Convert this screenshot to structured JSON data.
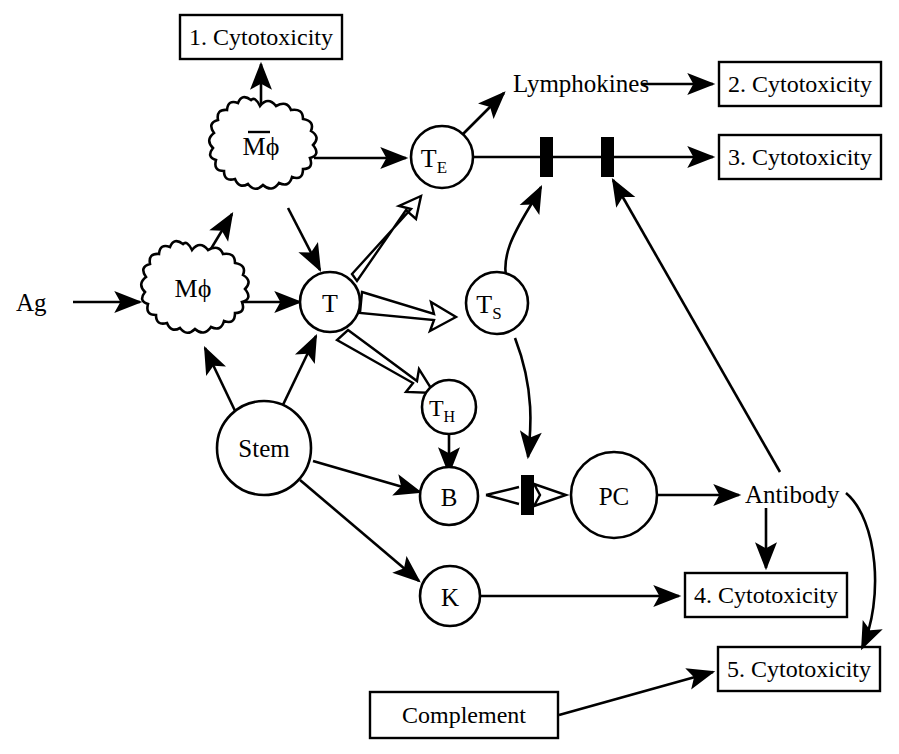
{
  "diagram": {
    "background_color": "#ffffff",
    "stroke_color": "#000000",
    "nodes": {
      "ag": {
        "label": "Ag",
        "type": "plain-text"
      },
      "macrophage": {
        "label": "Mϕ",
        "type": "wavy-circle"
      },
      "activated_macrophage": {
        "label": "Mϕ",
        "overbar": true,
        "type": "wavy-circle"
      },
      "t_cell": {
        "label": "T",
        "type": "circle"
      },
      "te_cell": {
        "label": "T",
        "sub": "E",
        "type": "circle"
      },
      "ts_cell": {
        "label": "T",
        "sub": "S",
        "type": "circle"
      },
      "th_cell": {
        "label": "T",
        "sub": "H",
        "type": "circle"
      },
      "b_cell": {
        "label": "B",
        "type": "circle"
      },
      "k_cell": {
        "label": "K",
        "type": "circle"
      },
      "pc_cell": {
        "label": "PC",
        "type": "circle"
      },
      "stem_cell": {
        "label": "Stem",
        "type": "circle"
      },
      "lymphokines": {
        "label": "Lymphokines",
        "type": "plain-text"
      },
      "antibody": {
        "label": "Antibody",
        "type": "plain-text"
      }
    },
    "boxes": [
      {
        "id": "box1",
        "label": "1. Cytotoxicity"
      },
      {
        "id": "box2",
        "label": "2. Cytotoxicity"
      },
      {
        "id": "box3",
        "label": "3. Cytotoxicity"
      },
      {
        "id": "box4",
        "label": "4. Cytotoxicity"
      },
      {
        "id": "box5",
        "label": "5. Cytotoxicity"
      },
      {
        "id": "complement",
        "label": "Complement"
      }
    ],
    "inhibition_bars": [
      {
        "id": "bar-te-1",
        "note": "first bar on T-E to 3. Cytotoxicity line"
      },
      {
        "id": "bar-te-2",
        "note": "second bar on T-E to 3. Cytotoxicity line"
      },
      {
        "id": "bar-b-pc",
        "note": "bar between B and PC"
      }
    ],
    "edges": [
      {
        "from": "Ag",
        "to": "Mϕ",
        "style": "solid-arrow"
      },
      {
        "from": "Mϕ",
        "to": "T",
        "style": "solid-arrow"
      },
      {
        "from": "Mϕ",
        "to": "Mϕ (activated)",
        "style": "solid-arrow"
      },
      {
        "from": "Mϕ (activated)",
        "to": "1. Cytotoxicity",
        "style": "solid-arrow"
      },
      {
        "from": "Mϕ (activated)",
        "to": "T",
        "style": "solid-arrow"
      },
      {
        "from": "Mϕ (activated)",
        "to": "T_E",
        "style": "solid-arrow"
      },
      {
        "from": "Stem",
        "to": "Mϕ",
        "style": "solid-arrow"
      },
      {
        "from": "Stem",
        "to": "T",
        "style": "solid-arrow"
      },
      {
        "from": "Stem",
        "to": "B",
        "style": "solid-arrow"
      },
      {
        "from": "Stem",
        "to": "K",
        "style": "solid-arrow"
      },
      {
        "from": "T",
        "to": "T_E",
        "style": "open-arrow"
      },
      {
        "from": "T",
        "to": "T_S",
        "style": "open-arrow"
      },
      {
        "from": "T",
        "to": "T_H",
        "style": "open-arrow"
      },
      {
        "from": "T_E",
        "to": "Lymphokines",
        "style": "solid-arrow"
      },
      {
        "from": "Lymphokines",
        "to": "2. Cytotoxicity",
        "style": "solid-arrow"
      },
      {
        "from": "T_E",
        "to": "3. Cytotoxicity",
        "style": "solid-line-with-two-bars"
      },
      {
        "from": "T_S",
        "to": "bar-te-1",
        "style": "curved-arrow"
      },
      {
        "from": "T_S",
        "to": "bar-b-pc",
        "style": "curved-arrow"
      },
      {
        "from": "Antibody",
        "to": "bar-te-2",
        "style": "solid-arrow"
      },
      {
        "from": "T_H",
        "to": "B",
        "style": "solid-arrow"
      },
      {
        "from": "B",
        "to": "PC",
        "style": "open-arrow-with-bar"
      },
      {
        "from": "PC",
        "to": "Antibody",
        "style": "solid-arrow"
      },
      {
        "from": "Antibody",
        "to": "4. Cytotoxicity",
        "style": "solid-arrow"
      },
      {
        "from": "Antibody",
        "to": "5. Cytotoxicity",
        "style": "curved-arrow"
      },
      {
        "from": "K",
        "to": "4. Cytotoxicity",
        "style": "solid-arrow"
      },
      {
        "from": "Complement",
        "to": "5. Cytotoxicity",
        "style": "solid-arrow"
      }
    ]
  }
}
